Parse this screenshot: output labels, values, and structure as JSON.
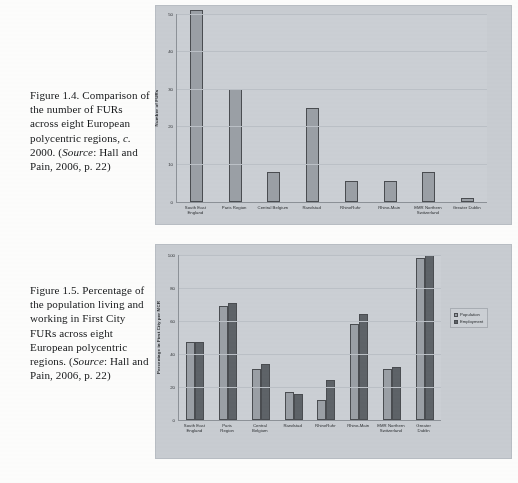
{
  "page": {
    "figure_1_caption_parts": {
      "lead": "Figure 1.4. Comparison of the number of FURs across eight European polycentric regions, ",
      "italic_c": "c.",
      "mid": " 2000. (",
      "italic_source": "Source",
      "tail": ": Hall and Pain, 2006, p. 22)"
    },
    "figure_2_caption_parts": {
      "lead": "Figure 1.5. Percentage of the population living and working in First City FURs across eight European polycentric regions. (",
      "italic_source": "Source",
      "tail": ": Hall and Pain, 2006, p. 22)"
    }
  },
  "colors": {
    "series_population": "#9ba0a6",
    "series_employment": "#5e6368",
    "plot_background": "#ccd0d5",
    "figure_background": "#c9cdd2",
    "axis": "#8d9298",
    "gridline": "#bcc1c7"
  },
  "chart_data": [
    {
      "id": "figure-1-4",
      "type": "bar",
      "title": "",
      "xlabel": "",
      "ylabel": "Number of FURs",
      "ylim": [
        0,
        50
      ],
      "yticks": [
        0,
        10,
        20,
        30,
        40,
        50
      ],
      "ytick_labels": [
        "0",
        "10",
        "20",
        "30",
        "40",
        "50"
      ],
      "grid": true,
      "legend": false,
      "categories": [
        "South East England",
        "Paris Region",
        "Central Belgium",
        "Randstad",
        "RhineRuhr",
        "Rhine-Main",
        "EMR Northern Switzerland",
        "Greater Dublin"
      ],
      "values": [
        51,
        30,
        8,
        25,
        5.5,
        5.5,
        8,
        1
      ]
    },
    {
      "id": "figure-1-5",
      "type": "bar",
      "title": "",
      "xlabel": "",
      "ylabel": "Percentage in First City per MCR",
      "ylim": [
        0,
        100
      ],
      "yticks": [
        0,
        20,
        40,
        60,
        80,
        100
      ],
      "ytick_labels": [
        "0",
        "20",
        "40",
        "60",
        "80",
        "100"
      ],
      "grid": true,
      "legend": true,
      "legend_position": "right",
      "categories": [
        "South East England",
        "Paris Region",
        "Central Belgium",
        "Randstad",
        "RhineRuhr",
        "Rhine-Main",
        "EMR Northern Switzerland",
        "Greater Dublin"
      ],
      "series": [
        {
          "name": "Population",
          "values": [
            47,
            69,
            31,
            17,
            12,
            58,
            31,
            98
          ]
        },
        {
          "name": "Employment",
          "values": [
            47,
            71,
            34,
            16,
            24,
            64,
            32,
            100
          ]
        }
      ]
    }
  ]
}
